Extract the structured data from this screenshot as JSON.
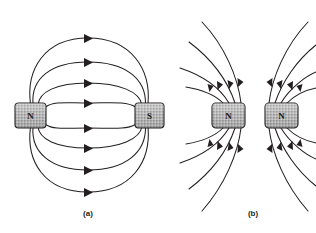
{
  "figure": {
    "background_color": "#ffffff",
    "line_color": "#231f20",
    "magnet_fill_color": "#b3b3b3",
    "magnet_border_color": "#231f20",
    "width": 316,
    "height": 233
  },
  "panels": [
    {
      "id": "a",
      "caption": "(a)",
      "caption_x": 88,
      "caption_y": 216,
      "description": "Unlike poles attract: field lines run from N to S",
      "magnets": [
        {
          "pole": "N",
          "label": "N",
          "x": 15,
          "y": 103,
          "w": 31,
          "h": 25,
          "cx": 30.5,
          "cy": 115.5
        },
        {
          "pole": "S",
          "label": "S",
          "x": 135,
          "y": 103,
          "w": 29,
          "h": 25,
          "cx": 149.5,
          "cy": 115.5
        }
      ],
      "field_line_count": 8,
      "arrow_x": 88,
      "arrow_ys": [
        38,
        62,
        83,
        103,
        128,
        148,
        170,
        192
      ]
    },
    {
      "id": "b",
      "caption": "(b)",
      "caption_x": 253,
      "caption_y": 216,
      "description": "Like poles repel: field lines from both N poles curve away from each other",
      "magnets": [
        {
          "pole": "N",
          "label": "N",
          "x": 212,
          "y": 103,
          "w": 33,
          "h": 25,
          "cx": 228.5,
          "cy": 115.5
        },
        {
          "pole": "N",
          "label": "N",
          "x": 265,
          "y": 103,
          "w": 33,
          "h": 25,
          "cx": 281.5,
          "cy": 115.5
        }
      ],
      "field_line_count": 12
    }
  ]
}
